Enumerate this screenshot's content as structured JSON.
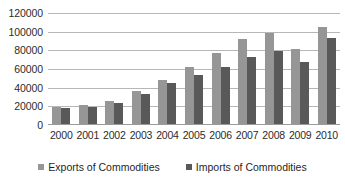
{
  "chart_data": {
    "type": "bar",
    "title": "",
    "subtitle": "",
    "xlabel": "",
    "ylabel": "",
    "categories": [
      "2000",
      "2001",
      "2002",
      "2003",
      "2004",
      "2005",
      "2006",
      "2007",
      "2008",
      "2009",
      "2010"
    ],
    "series": [
      {
        "name": "Exports of Commodities",
        "color": "#969696",
        "values": [
          19500,
          21500,
          26000,
          36000,
          48000,
          62000,
          77000,
          92000,
          99000,
          81000,
          105000
        ]
      },
      {
        "name": "Imports of Commodities",
        "color": "#595959",
        "values": [
          18500,
          19500,
          23500,
          33500,
          45500,
          53500,
          62500,
          72500,
          79000,
          67500,
          93000
        ]
      }
    ],
    "ylim": [
      0,
      120000
    ],
    "ytick_labels": [
      "120000",
      "100000",
      "80000",
      "60000",
      "40000",
      "20000",
      "0"
    ],
    "ytick_values": [
      120000,
      100000,
      80000,
      60000,
      40000,
      20000,
      0
    ],
    "grid": true,
    "legend_position": "bottom"
  }
}
